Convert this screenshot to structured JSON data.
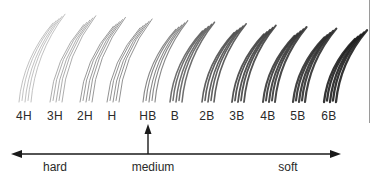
{
  "diagram": {
    "grades": [
      {
        "label": "4H",
        "x": 24,
        "shade": "#a8a8a8",
        "width": 0.8
      },
      {
        "label": "3H",
        "x": 55,
        "shade": "#9a9a9a",
        "width": 0.9
      },
      {
        "label": "2H",
        "x": 85,
        "shade": "#8e8e8e",
        "width": 1.0
      },
      {
        "label": "H",
        "x": 112,
        "shade": "#858585",
        "width": 1.0
      },
      {
        "label": "HB",
        "x": 148,
        "shade": "#7a7a7a",
        "width": 1.1
      },
      {
        "label": "B",
        "x": 175,
        "shade": "#5e5e5e",
        "width": 1.5
      },
      {
        "label": "2B",
        "x": 207,
        "shade": "#4e4e4e",
        "width": 1.6
      },
      {
        "label": "3B",
        "x": 237,
        "shade": "#404040",
        "width": 1.8
      },
      {
        "label": "4B",
        "x": 268,
        "shade": "#353535",
        "width": 2.0
      },
      {
        "label": "5B",
        "x": 298,
        "shade": "#2e2e2e",
        "width": 2.2
      },
      {
        "label": "6B",
        "x": 329,
        "shade": "#1e1e1e",
        "width": 2.3
      }
    ],
    "scale": {
      "left_label": "hard",
      "middle_label": "medium",
      "right_label": "soft",
      "left_label_x": 55,
      "middle_label_x": 153,
      "right_label_x": 288,
      "marker_grade": "HB"
    },
    "colors": {
      "background": "#ffffff",
      "text": "#2a2a2a",
      "arrow": "#1a1a1a"
    }
  }
}
